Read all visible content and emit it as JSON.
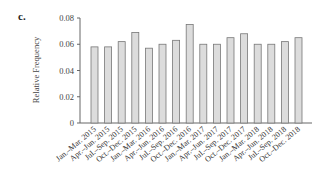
{
  "panel_label": "c.",
  "chart_data": {
    "type": "bar",
    "title": "",
    "xlabel": "",
    "ylabel": "Relative Frequency",
    "ylim": [
      0,
      0.08
    ],
    "yticks": [
      "0",
      "0.02",
      "0.04",
      "0.06",
      "0.08"
    ],
    "grid": false,
    "legend": null,
    "bar_color": "#dcdcdc",
    "bar_edge_color": "#777777",
    "categories": [
      "Jan.–Mar. 2015",
      "Apr.–Jun. 2015",
      "Jul.–Sep. 2015",
      "Oct.–Dec. 2015",
      "Jan.–Mar. 2016",
      "Apr.–Jun. 2016",
      "Jul.–Sep. 2016",
      "Oct.–Dec. 2016",
      "Jan.–Mar. 2017",
      "Apr.–Jun. 2017",
      "Jul.–Sep. 2017",
      "Oct.–Dec. 2017",
      "Jan.–Mar. 2018",
      "Apr.–Jun. 2018",
      "Jul.–Sep. 2018",
      "Oct.–Dec. 2018"
    ],
    "values": [
      0.058,
      0.058,
      0.062,
      0.069,
      0.057,
      0.06,
      0.063,
      0.075,
      0.06,
      0.06,
      0.065,
      0.068,
      0.06,
      0.06,
      0.062,
      0.065
    ]
  }
}
